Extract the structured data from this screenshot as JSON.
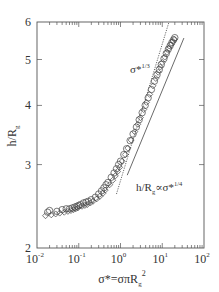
{
  "chart_data": {
    "type": "scatter",
    "title": "",
    "xlabel": "σ*=σπR_g^2",
    "ylabel": "h/R_g",
    "xscale": "log",
    "yscale": "log",
    "xlim": [
      0.01,
      100
    ],
    "ylim": [
      2,
      6
    ],
    "x_ticks": [
      {
        "value": 0.01,
        "label": "10",
        "exp": "-2"
      },
      {
        "value": 0.1,
        "label": "10",
        "exp": "-1"
      },
      {
        "value": 1,
        "label": "10",
        "exp": "0"
      },
      {
        "value": 10,
        "label": "10",
        "exp": "1"
      },
      {
        "value": 100,
        "label": "10",
        "exp": "2"
      }
    ],
    "y_ticks": [
      {
        "value": 2,
        "label": "2"
      },
      {
        "value": 3,
        "label": "3"
      },
      {
        "value": 4,
        "label": "4"
      },
      {
        "value": 5,
        "label": "5"
      },
      {
        "value": 6,
        "label": "6"
      }
    ],
    "grid": false,
    "legend": null,
    "series": [
      {
        "name": "circles",
        "marker": "open-circle",
        "x": [
          0.018,
          0.02,
          0.03,
          0.04,
          0.05,
          0.06,
          0.07,
          0.08,
          0.09,
          0.1,
          0.11,
          0.13,
          0.15,
          0.17,
          0.2,
          0.25,
          0.3,
          0.35,
          0.4,
          0.45,
          0.5,
          0.6,
          0.7,
          0.8,
          0.9,
          1.0,
          1.2,
          1.4,
          1.7,
          2.0,
          2.4,
          2.8,
          3.3,
          3.9,
          4.6,
          5.5,
          6.5,
          7.5,
          8.5,
          9.5,
          11,
          12.5,
          14,
          15.5,
          17,
          18.5,
          20
        ],
        "y": [
          2.38,
          2.4,
          2.39,
          2.41,
          2.42,
          2.42,
          2.43,
          2.44,
          2.45,
          2.46,
          2.47,
          2.49,
          2.5,
          2.51,
          2.53,
          2.56,
          2.6,
          2.64,
          2.68,
          2.72,
          2.75,
          2.82,
          2.88,
          2.94,
          3.0,
          3.05,
          3.15,
          3.24,
          3.37,
          3.48,
          3.6,
          3.73,
          3.86,
          4.0,
          4.15,
          4.32,
          4.5,
          4.64,
          4.76,
          4.88,
          5.02,
          5.15,
          5.26,
          5.35,
          5.43,
          5.5,
          5.56
        ]
      },
      {
        "name": "diamonds",
        "marker": "open-diamond",
        "x": [
          0.016,
          0.022,
          0.028,
          0.035,
          0.045,
          0.055,
          0.065,
          0.075,
          0.085,
          0.095,
          0.12,
          0.14,
          0.16,
          0.19,
          0.22,
          0.27,
          0.32,
          0.38,
          0.43,
          0.55,
          0.65,
          0.75,
          0.85,
          0.95,
          1.1,
          1.3,
          1.5,
          1.8,
          2.2,
          2.6,
          3.0,
          3.6,
          4.2,
          5.0,
          6.0,
          7.0,
          8.0,
          9.0,
          10,
          11.5,
          13,
          14.5,
          16,
          18,
          19.5
        ],
        "y": [
          2.34,
          2.35,
          2.36,
          2.37,
          2.38,
          2.39,
          2.4,
          2.41,
          2.42,
          2.43,
          2.45,
          2.46,
          2.47,
          2.49,
          2.51,
          2.54,
          2.57,
          2.61,
          2.65,
          2.72,
          2.78,
          2.84,
          2.9,
          2.96,
          3.05,
          3.15,
          3.25,
          3.38,
          3.52,
          3.65,
          3.77,
          3.92,
          4.06,
          4.22,
          4.4,
          4.56,
          4.7,
          4.82,
          4.93,
          5.06,
          5.18,
          5.28,
          5.37,
          5.46,
          5.52
        ]
      }
    ],
    "reference_lines": [
      {
        "name": "σ*^1/3",
        "style": "dotted",
        "x": [
          0.8,
          14.5
        ],
        "y": [
          2.6,
          6.0
        ],
        "slope": "1/3"
      },
      {
        "name": "h/Rg ∝ σ*^1/4",
        "style": "solid",
        "x": [
          1.45,
          33
        ],
        "y": [
          2.85,
          5.55
        ],
        "slope": "1/4"
      }
    ],
    "annotations": [
      {
        "text": "σ*",
        "sup": "1/3",
        "x": 2.2,
        "y": 4.4
      },
      {
        "text": "h/R",
        "sub": "g",
        "mid": "∝σ*",
        "sup": "1/4",
        "x": 3.5,
        "y": 2.75
      }
    ]
  },
  "labels": {
    "ylabel_main": "h/R",
    "ylabel_sub": "g",
    "xlabel_main": "σ*=σπR",
    "xlabel_sub": "g",
    "xlabel_sup": "2",
    "ann1_main": "σ*",
    "ann1_sup": "1/3",
    "ann2_main": "h/R",
    "ann2_sub": "g",
    "ann2_mid": "∝σ*",
    "ann2_sup": "1/4"
  }
}
